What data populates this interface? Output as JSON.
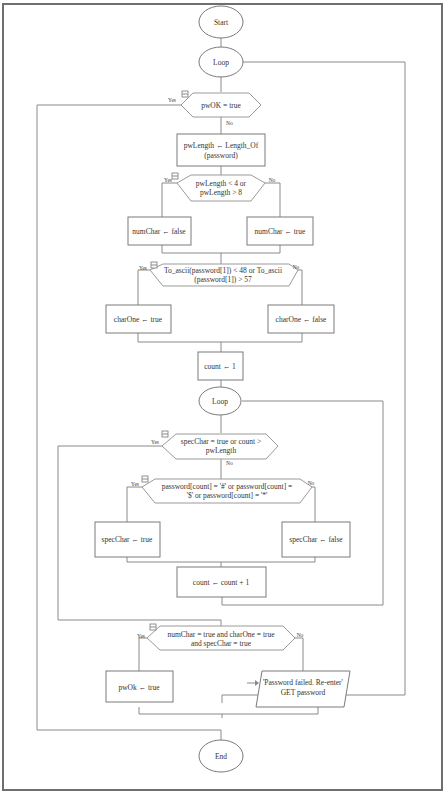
{
  "flowchart": {
    "start": "Start",
    "end": "End",
    "outer_loop": "Loop",
    "inner_loop": "Loop",
    "decision_pwok": "pwOK = true",
    "assign_length": [
      "pwLength ← Length_Of",
      "(password)"
    ],
    "decision_length": [
      "pwLength < 4 or",
      "pwLength > 8"
    ],
    "numchar_false": "numChar ← false",
    "numchar_true": "numChar ← true",
    "decision_ascii": [
      "To_ascii(password[1]) < 48 or To_ascii",
      "(password[1]) > 57"
    ],
    "charone_true": "charOne ← true",
    "charone_false": "charOne ← false",
    "count_init": "count ← 1",
    "decision_loop_exit": [
      "specChar = true or count >",
      "pwLength"
    ],
    "decision_special": [
      "password[count] = '#' or password[count] =",
      "'$' or password[count] = '*'"
    ],
    "specchar_true": "specChar ← true",
    "specchar_false": "specChar ← false",
    "count_increment": "count ← count + 1",
    "decision_final": [
      "numChar = true and charOne = true",
      "and specChar = true"
    ],
    "pwok_true": "pwOk ← true",
    "output_failed": [
      "'Password failed. Re-enter'",
      "GET password"
    ],
    "yes_label": "Yes",
    "no_label": "No"
  }
}
